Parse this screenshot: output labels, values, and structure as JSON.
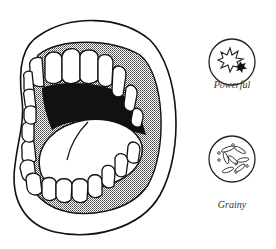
{
  "figure": {
    "main_illustration": "open-mouth",
    "icons": [
      {
        "name": "powerful",
        "label": "Powerful",
        "glyph": "starburst-explosion"
      },
      {
        "name": "grainy",
        "label": "Grainy",
        "glyph": "grain-particles"
      }
    ]
  },
  "colors": {
    "stroke": "#111111",
    "background": "#ffffff",
    "throat": "#111111",
    "gum_shade": "#8a8a8a"
  }
}
